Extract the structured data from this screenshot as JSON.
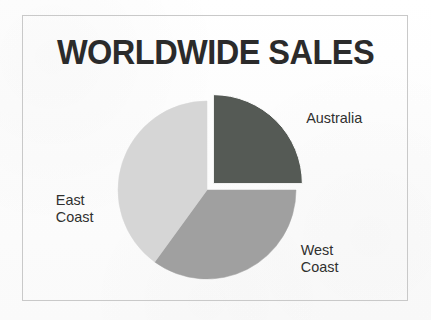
{
  "figure": {
    "title": "WORLDWIDE SALES",
    "frame_color": "#c9c9c9",
    "background_color": "#fdfdfd",
    "title_color": "#2b2b2b",
    "label_color": "#30302f"
  },
  "chart_data": {
    "type": "pie",
    "title": "WORLDWIDE SALES",
    "xlabel": "",
    "ylabel": "",
    "legend_position": "none",
    "labels_placement": "outside-callout",
    "grid": false,
    "categories": [
      "Australia",
      "West Coast",
      "East Coast"
    ],
    "values": [
      25,
      35,
      40
    ],
    "value_unit": "percent",
    "colors": [
      "#555a55",
      "#a0a0a0",
      "#d6d6d6"
    ],
    "exploded": [
      "Australia"
    ],
    "explode_offset_px": 9,
    "start_angle_deg": 0,
    "direction": "clockwise",
    "center_px": [
      207,
      190
    ],
    "radius_px": 89,
    "slices": [
      {
        "name": "Australia",
        "label": "Australia",
        "value": 25,
        "color": "#555a55",
        "start_angle_deg": 0,
        "end_angle_deg": 90,
        "exploded": true
      },
      {
        "name": "West Coast",
        "label": "West\nCoast",
        "value": 35,
        "color": "#a0a0a0",
        "start_angle_deg": 90,
        "end_angle_deg": 216,
        "exploded": false
      },
      {
        "name": "East Coast",
        "label": "East\nCoast",
        "value": 40,
        "color": "#d6d6d6",
        "start_angle_deg": 216,
        "end_angle_deg": 360,
        "exploded": false
      }
    ]
  },
  "labels": {
    "australia": "Australia",
    "east_coast": "East\nCoast",
    "west_coast": "West\nCoast"
  }
}
